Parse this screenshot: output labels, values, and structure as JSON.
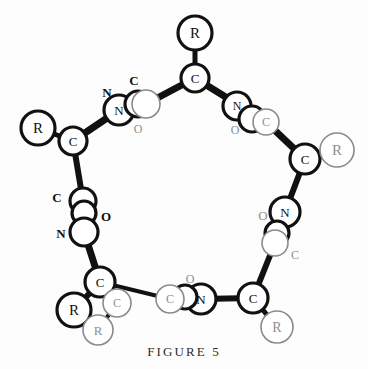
{
  "figure": {
    "caption": "FIGURE 5",
    "colors": {
      "bond_dark": "#111111",
      "atom_outline_bold": "#111111",
      "atom_outline_light": "#8a8a8a",
      "label_dark": "#111111",
      "label_light": "#8e8e8e",
      "background": "#fdfdfd"
    }
  },
  "atoms": [
    {
      "id": "a1",
      "label": "R",
      "x": 195,
      "y": 33,
      "r": 17,
      "weight": "bold",
      "font": 15
    },
    {
      "id": "a2",
      "label": "C",
      "x": 195,
      "y": 78,
      "r": 14,
      "weight": "bold",
      "font": 13
    },
    {
      "id": "a3",
      "label": "N",
      "x": 237,
      "y": 106,
      "r": 14,
      "weight": "bold",
      "font": 12
    },
    {
      "id": "a4",
      "label": "",
      "x": 252,
      "y": 119,
      "r": 13,
      "weight": "bold",
      "font": 11
    },
    {
      "id": "a5",
      "label": "C",
      "x": 266,
      "y": 122,
      "r": 13,
      "weight": "light",
      "font": 12
    },
    {
      "id": "a6",
      "label": "C",
      "x": 305,
      "y": 159,
      "r": 15,
      "weight": "bold",
      "font": 13
    },
    {
      "id": "a7",
      "label": "R",
      "x": 337,
      "y": 150,
      "r": 17,
      "weight": "light",
      "font": 15
    },
    {
      "id": "a8",
      "label": "N",
      "x": 285,
      "y": 212,
      "r": 15,
      "weight": "bold",
      "font": 13
    },
    {
      "id": "a9",
      "label": "",
      "x": 277,
      "y": 233,
      "r": 12,
      "weight": "bold",
      "font": 11
    },
    {
      "id": "a10",
      "label": "",
      "x": 275,
      "y": 243,
      "r": 13,
      "weight": "light",
      "font": 11
    },
    {
      "id": "a11",
      "label": "C",
      "x": 253,
      "y": 298,
      "r": 15,
      "weight": "bold",
      "font": 13
    },
    {
      "id": "a12",
      "label": "R",
      "x": 277,
      "y": 327,
      "r": 16,
      "weight": "light",
      "font": 14
    },
    {
      "id": "a13",
      "label": "N",
      "x": 201,
      "y": 299,
      "r": 15,
      "weight": "bold",
      "font": 13
    },
    {
      "id": "a14",
      "label": "",
      "x": 185,
      "y": 297,
      "r": 12,
      "weight": "bold",
      "font": 11
    },
    {
      "id": "a15",
      "label": "C",
      "x": 170,
      "y": 299,
      "r": 14,
      "weight": "light",
      "font": 12
    },
    {
      "id": "a16",
      "label": "C",
      "x": 100,
      "y": 282,
      "r": 15,
      "weight": "bold",
      "font": 13
    },
    {
      "id": "a17",
      "label": "R",
      "x": 74,
      "y": 310,
      "r": 17,
      "weight": "bold",
      "font": 15
    },
    {
      "id": "a18",
      "label": "C",
      "x": 117,
      "y": 303,
      "r": 14,
      "weight": "light",
      "font": 12
    },
    {
      "id": "a19",
      "label": "R",
      "x": 98,
      "y": 330,
      "r": 15,
      "weight": "light",
      "font": 13
    },
    {
      "id": "a20",
      "label": "",
      "x": 83,
      "y": 201,
      "r": 13,
      "weight": "bold",
      "font": 11
    },
    {
      "id": "a21",
      "label": "",
      "x": 84,
      "y": 213,
      "r": 12,
      "weight": "bold",
      "font": 11
    },
    {
      "id": "a22",
      "label": "",
      "x": 84,
      "y": 232,
      "r": 14,
      "weight": "bold",
      "font": 11
    },
    {
      "id": "a23",
      "label": "C",
      "x": 73,
      "y": 141,
      "r": 14,
      "weight": "bold",
      "font": 13
    },
    {
      "id": "a24",
      "label": "R",
      "x": 38,
      "y": 128,
      "r": 17,
      "weight": "bold",
      "font": 15
    },
    {
      "id": "a25",
      "label": "N",
      "x": 119,
      "y": 110,
      "r": 15,
      "weight": "bold",
      "font": 13
    },
    {
      "id": "a26",
      "label": "",
      "x": 138,
      "y": 104,
      "r": 13,
      "weight": "bold",
      "font": 11
    },
    {
      "id": "a27",
      "label": "",
      "x": 146,
      "y": 104,
      "r": 14,
      "weight": "light",
      "font": 11
    }
  ],
  "bonds": [
    {
      "from": "a2",
      "to": "a1",
      "w": 5,
      "style": "dark"
    },
    {
      "from": "a2",
      "to": "a27",
      "w": 7,
      "style": "dark"
    },
    {
      "from": "a2",
      "to": "a5",
      "w": 7,
      "style": "dark"
    },
    {
      "from": "a5",
      "to": "a6",
      "w": 7,
      "style": "dark"
    },
    {
      "from": "a6",
      "to": "a7",
      "w": 5,
      "style": "dark"
    },
    {
      "from": "a6",
      "to": "a8",
      "w": 6,
      "style": "dark"
    },
    {
      "from": "a10",
      "to": "a11",
      "w": 6,
      "style": "dark"
    },
    {
      "from": "a11",
      "to": "a12",
      "w": 5,
      "style": "dark"
    },
    {
      "from": "a11",
      "to": "a13",
      "w": 6,
      "style": "dark"
    },
    {
      "from": "a15",
      "to": "a16",
      "w": 4,
      "style": "dark"
    },
    {
      "from": "a16",
      "to": "a17",
      "w": 6,
      "style": "dark"
    },
    {
      "from": "a16",
      "to": "a18",
      "w": 4,
      "style": "dark"
    },
    {
      "from": "a18",
      "to": "a19",
      "w": 4,
      "style": "dark"
    },
    {
      "from": "a16",
      "to": "a22",
      "w": 7,
      "style": "dark"
    },
    {
      "from": "a20",
      "to": "a23",
      "w": 6,
      "style": "dark"
    },
    {
      "from": "a23",
      "to": "a24",
      "w": 5,
      "style": "dark"
    },
    {
      "from": "a23",
      "to": "a25",
      "w": 7,
      "style": "dark"
    }
  ],
  "labels": [
    {
      "id": "l1",
      "text": "N",
      "x": 107,
      "y": 92,
      "size": 13,
      "tone": "dark"
    },
    {
      "id": "l2",
      "text": "C",
      "x": 134,
      "y": 80,
      "size": 13,
      "tone": "dark"
    },
    {
      "id": "l3",
      "text": "O",
      "x": 138,
      "y": 129,
      "size": 12,
      "tone": "light"
    },
    {
      "id": "l4",
      "text": "O",
      "x": 235,
      "y": 130,
      "size": 12,
      "tone": "light"
    },
    {
      "id": "l5",
      "text": "C",
      "x": 57,
      "y": 197,
      "size": 13,
      "tone": "dark"
    },
    {
      "id": "l6",
      "text": "O",
      "x": 106,
      "y": 216,
      "size": 13,
      "tone": "dark"
    },
    {
      "id": "l7",
      "text": "N",
      "x": 61,
      "y": 233,
      "size": 13,
      "tone": "dark"
    },
    {
      "id": "l8",
      "text": "O",
      "x": 263,
      "y": 215,
      "size": 13,
      "tone": "light"
    },
    {
      "id": "l9",
      "text": "C",
      "x": 295,
      "y": 255,
      "size": 12,
      "tone": "light"
    },
    {
      "id": "l10",
      "text": "O",
      "x": 190,
      "y": 279,
      "size": 12,
      "tone": "light"
    }
  ]
}
